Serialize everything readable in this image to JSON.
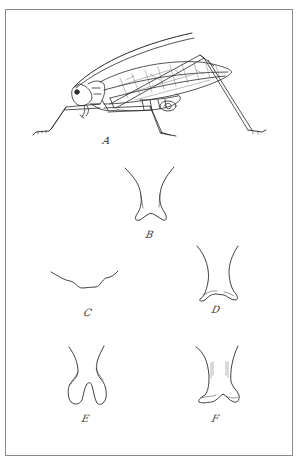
{
  "plate": {
    "border_color": "#8a8a8a",
    "ink_color": "#2a2a2a",
    "figures": [
      {
        "id": "A",
        "label": "A",
        "subject": "katydid-lateral-view",
        "label_pos": [
          103,
          137
        ]
      },
      {
        "id": "B",
        "label": "B",
        "subject": "structure-outline",
        "label_pos": [
          146,
          230
        ]
      },
      {
        "id": "C",
        "label": "C",
        "subject": "margin-outline",
        "label_pos": [
          84,
          310
        ]
      },
      {
        "id": "D",
        "label": "D",
        "subject": "structure-outline",
        "label_pos": [
          212,
          306
        ]
      },
      {
        "id": "E",
        "label": "E",
        "subject": "structure-outline",
        "label_pos": [
          82,
          416
        ]
      },
      {
        "id": "F",
        "label": "F",
        "subject": "structure-outline",
        "label_pos": [
          212,
          416
        ]
      }
    ]
  }
}
